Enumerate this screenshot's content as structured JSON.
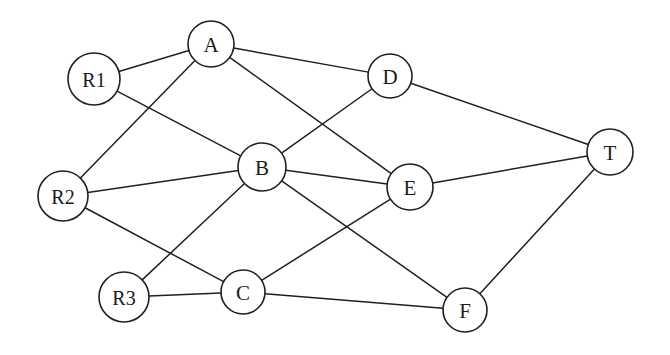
{
  "figure": {
    "type": "network-graph",
    "title": "",
    "background_color": "#ffffff",
    "node_fill_color": "#ffffff",
    "node_stroke_color": "#231f20",
    "edge_color": "#231f20",
    "label_color": "#1a1a1a"
  },
  "graph_data": {
    "type": "graph",
    "directed": false,
    "node_count": 10,
    "edge_count": 16,
    "nodes": [
      {
        "id": "R1",
        "label": "R1",
        "x": 94,
        "y": 79,
        "r": 26
      },
      {
        "id": "A",
        "label": "A",
        "x": 211,
        "y": 44,
        "r": 23
      },
      {
        "id": "D",
        "label": "D",
        "x": 390,
        "y": 76,
        "r": 22
      },
      {
        "id": "T",
        "label": "T",
        "x": 610,
        "y": 152,
        "r": 23
      },
      {
        "id": "B",
        "label": "B",
        "x": 262,
        "y": 167,
        "r": 24
      },
      {
        "id": "E",
        "label": "E",
        "x": 410,
        "y": 187,
        "r": 23
      },
      {
        "id": "R2",
        "label": "R2",
        "x": 63,
        "y": 196,
        "r": 25
      },
      {
        "id": "R3",
        "label": "R3",
        "x": 124,
        "y": 297,
        "r": 25
      },
      {
        "id": "C",
        "label": "C",
        "x": 243,
        "y": 292,
        "r": 22
      },
      {
        "id": "F",
        "label": "F",
        "x": 465,
        "y": 310,
        "r": 22
      }
    ],
    "edges": [
      {
        "source": "R1",
        "target": "A"
      },
      {
        "source": "R1",
        "target": "B"
      },
      {
        "source": "A",
        "target": "D"
      },
      {
        "source": "A",
        "target": "R2"
      },
      {
        "source": "A",
        "target": "E"
      },
      {
        "source": "D",
        "target": "T"
      },
      {
        "source": "D",
        "target": "B"
      },
      {
        "source": "R2",
        "target": "B"
      },
      {
        "source": "R2",
        "target": "C"
      },
      {
        "source": "B",
        "target": "E"
      },
      {
        "source": "B",
        "target": "R3"
      },
      {
        "source": "B",
        "target": "F"
      },
      {
        "source": "E",
        "target": "T"
      },
      {
        "source": "E",
        "target": "C"
      },
      {
        "source": "R3",
        "target": "C"
      },
      {
        "source": "C",
        "target": "F"
      },
      {
        "source": "F",
        "target": "T"
      }
    ]
  }
}
